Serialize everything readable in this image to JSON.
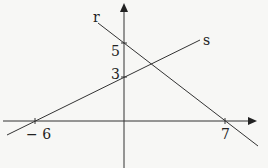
{
  "diagram": {
    "type": "coordinate-plane-lines",
    "axes": {
      "x_arrow": true,
      "y_arrow": true
    },
    "lines": [
      {
        "name": "r",
        "label": "r",
        "y_intercept": 5,
        "x_intercept": 7
      },
      {
        "name": "s",
        "label": "s",
        "y_intercept": 3,
        "x_intercept": -6
      }
    ],
    "tick_labels": {
      "y5": "5",
      "y3": "3",
      "xneg6": "− 6",
      "x7": "7"
    },
    "colors": {
      "line": "#333333",
      "background": "#f7f7f5"
    }
  }
}
